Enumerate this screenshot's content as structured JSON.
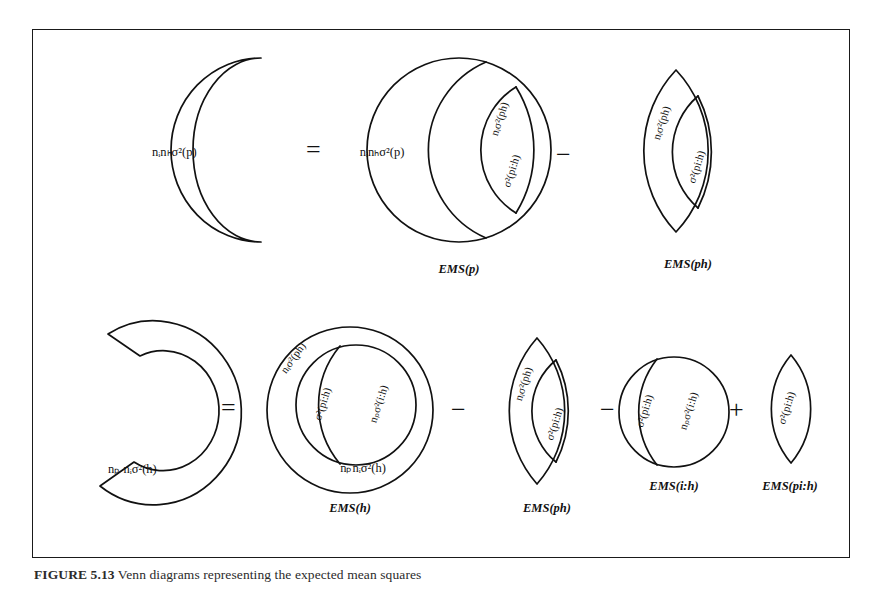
{
  "figure": {
    "caption_label": "FIGURE 5.13",
    "caption_text": "Venn diagrams representing the expected mean squares",
    "frame_color": "#1a1a1a",
    "ink_color": "#111111",
    "background": "#ffffff"
  },
  "rows": [
    {
      "id": "row-p",
      "lhs": {
        "shape": "crescent",
        "label": "nᵢnₕσ²(p)"
      },
      "terms": [
        {
          "operator": "=",
          "shape": "circle-with-lenses",
          "ems": "EMS(p)",
          "regions": [
            {
              "name": "outer",
              "label": "nᵢnₕσ²(p)"
            },
            {
              "name": "mid-lens",
              "label": "nᵢσ²(ph)"
            },
            {
              "name": "inner-lens",
              "label": "σ²(pi:h)"
            }
          ]
        },
        {
          "operator": "−",
          "shape": "lens",
          "ems": "EMS(ph)",
          "regions": [
            {
              "name": "outer-lens",
              "label": "nᵢσ²(ph)"
            },
            {
              "name": "inner-lens",
              "label": "σ²(pi:h)"
            }
          ]
        }
      ]
    },
    {
      "id": "row-h",
      "lhs": {
        "shape": "c-shape",
        "label": "nₚ nᵢσ²(h)"
      },
      "terms": [
        {
          "operator": "=",
          "shape": "circle-nested",
          "ems": "EMS(h)",
          "regions": [
            {
              "name": "outer",
              "label": "nₚnᵢσ²(h)"
            },
            {
              "name": "upper-left",
              "label": "nᵢσ²(ph)"
            },
            {
              "name": "center-lens",
              "label": "σ²(pi:h)"
            },
            {
              "name": "right",
              "label": "nₚσ²(i:h)"
            }
          ]
        },
        {
          "operator": "−",
          "shape": "lens",
          "ems": "EMS(ph)",
          "regions": [
            {
              "name": "outer-lens",
              "label": "nᵢσ²(ph)"
            },
            {
              "name": "inner-lens",
              "label": "σ²(pi:h)"
            }
          ]
        },
        {
          "operator": "−",
          "shape": "circle-split",
          "ems": "EMS(i:h)",
          "regions": [
            {
              "name": "left",
              "label": "σ²(pi:h)"
            },
            {
              "name": "right",
              "label": "nₚσ²(i:h)"
            }
          ]
        },
        {
          "operator": "+",
          "shape": "small-lens",
          "ems": "EMS(pi:h)",
          "regions": [
            {
              "name": "lens",
              "label": "σ²(pi:h)"
            }
          ]
        }
      ]
    }
  ],
  "operators": {
    "equals": "=",
    "minus": "−",
    "plus": "+"
  }
}
